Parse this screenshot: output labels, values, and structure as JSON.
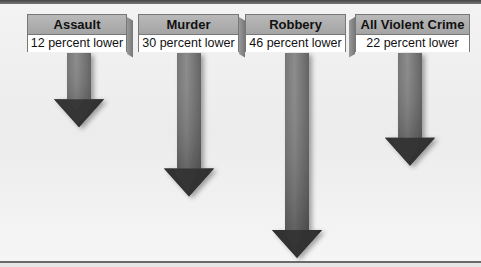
{
  "items": [
    {
      "label": "Assault",
      "value_text": "12 percent lower",
      "percent": 12
    },
    {
      "label": "Murder",
      "value_text": "30 percent lower",
      "percent": 30
    },
    {
      "label": "Robbery",
      "value_text": "46 percent lower",
      "percent": 46
    },
    {
      "label": "All Violent Crime",
      "value_text": "22 percent lower",
      "percent": 22
    }
  ],
  "colors": {
    "arrow_dark": "#2e2e2e",
    "arrow_light": "#8a8a8a",
    "header_gray": "#a9a9a9"
  }
}
